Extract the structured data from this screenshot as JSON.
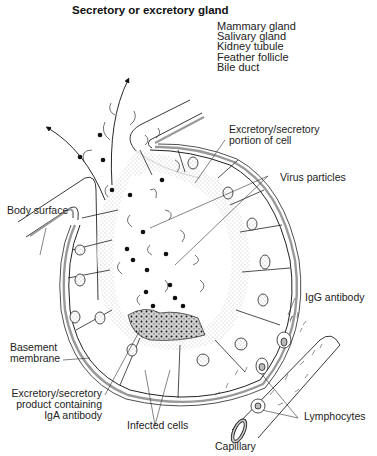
{
  "title": "Secretory or excretory gland",
  "examples": [
    "Mammary gland",
    "Salivary gland",
    "Kidney tubule",
    "Feather follicle",
    "Bile duct"
  ],
  "labels": {
    "body_surface": "Body surface",
    "excretory_portion": [
      "Excretory/secretory",
      "portion of cell"
    ],
    "virus_particles": "Virus particles",
    "igg_antibody": "IgG antibody",
    "basement_membrane": [
      "Basement",
      "membrane"
    ],
    "excretory_product": [
      "Excretory/secretory",
      "product containing",
      "IgA antibody"
    ],
    "infected_cells": "Infected cells",
    "lymphocytes": "Lymphocytes",
    "capillary": "Capillary"
  }
}
